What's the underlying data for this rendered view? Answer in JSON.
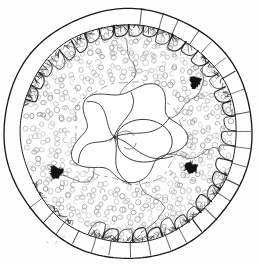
{
  "figure": {
    "type": "hand-drawn biological cross-section",
    "medium": "ink line drawing on white paper",
    "background_color": "#fefefe",
    "ink_color": "#1a1a1a",
    "faint_ink_color": "#9a9a9a",
    "blotch_color": "#141414"
  },
  "geometry": {
    "canvas_width": 259,
    "canvas_height": 264,
    "center_x": 128,
    "center_y": 133,
    "outer_ring_outer_radius": 124,
    "outer_ring_inner_radius": 108,
    "dot_band_outer_radius": 106,
    "dot_band_inner_radius": 52,
    "core_radius": 52
  },
  "structures": {
    "outer_ring": {
      "name": "outer segmented rim",
      "scallop_count": 34,
      "segment_tick_count": 26,
      "fringe_present": true,
      "fringe_description": "dark hairy fringe along inner rim edge, densest at top and bottom"
    },
    "dot_band": {
      "name": "middle band of small open circles",
      "circle_count": 470,
      "circle_radius_px": 2.4,
      "circle_stroke_color": "#8e8e8e",
      "arrangement": "dense quasi-radial rows"
    },
    "inner_boundary": {
      "name": "inner dashed boundary",
      "style": "dashed",
      "radius": 52,
      "stroke_color": "#8a8a8a"
    },
    "core": {
      "name": "central pinwheel of curved lobes",
      "lobe_count": 5,
      "description": "irregular curved lobes converging at an off-centre node"
    },
    "radial_lines": {
      "name": "wavy radial strands",
      "count": 5,
      "description": "thin wavy lines running from core outward across the dot band"
    },
    "blotches": [
      {
        "name": "dark blotch upper-right",
        "cx": 195,
        "cy": 82,
        "size": 13
      },
      {
        "name": "dark blotch lower-left",
        "cx": 56,
        "cy": 172,
        "size": 13
      },
      {
        "name": "dark blotch lower-right",
        "cx": 191,
        "cy": 168,
        "size": 13
      }
    ]
  },
  "labels": {
    "visible_text": "",
    "note": "no legible text or annotation appears in the drawing"
  }
}
